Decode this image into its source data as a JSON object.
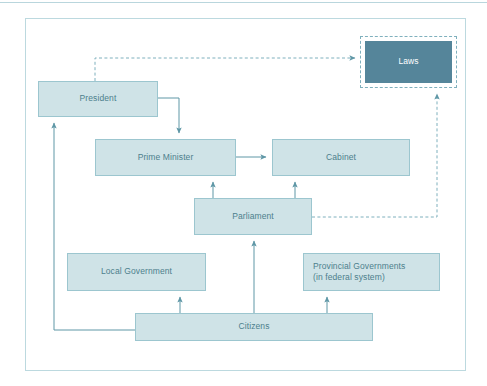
{
  "diagram": {
    "colors": {
      "node_fill": "#cfe3e7",
      "node_border": "#9cc6cf",
      "node_text": "#4d7f8c",
      "highlight_fill": "#55859a",
      "highlight_text": "#ffffff",
      "connector": "#5f97a6",
      "frame_border": "#bcd9df"
    },
    "nodes": [
      {
        "id": "laws",
        "label": "Laws",
        "style": "highlighted-dashed-outline"
      },
      {
        "id": "president",
        "label": "President",
        "style": "normal"
      },
      {
        "id": "prime_minister",
        "label": "Prime Minister",
        "style": "normal"
      },
      {
        "id": "cabinet",
        "label": "Cabinet",
        "style": "normal"
      },
      {
        "id": "parliament",
        "label": "Parliament",
        "style": "normal"
      },
      {
        "id": "local_government",
        "label": "Local Government",
        "style": "normal"
      },
      {
        "id": "provincial_governments",
        "label_line1": "Provincial Governments",
        "label_line2": "(in federal system)",
        "style": "normal-left-aligned"
      },
      {
        "id": "citizens",
        "label": "Citizens",
        "style": "normal"
      }
    ],
    "edges": [
      {
        "from": "president",
        "to": "laws",
        "line": "dashed",
        "arrow": "to"
      },
      {
        "from": "president",
        "to": "prime_minister",
        "line": "solid",
        "arrow": "to"
      },
      {
        "from": "prime_minister",
        "to": "cabinet",
        "line": "solid",
        "arrow": "to"
      },
      {
        "from": "parliament",
        "to": "prime_minister",
        "line": "solid",
        "arrow": "to"
      },
      {
        "from": "parliament",
        "to": "cabinet",
        "line": "solid",
        "arrow": "to"
      },
      {
        "from": "parliament",
        "to": "laws",
        "line": "dashed",
        "arrow": "to"
      },
      {
        "from": "citizens",
        "to": "parliament",
        "line": "solid",
        "arrow": "to"
      },
      {
        "from": "citizens",
        "to": "local_government",
        "line": "solid",
        "arrow": "to"
      },
      {
        "from": "citizens",
        "to": "provincial_governments",
        "line": "solid",
        "arrow": "to"
      },
      {
        "from": "citizens",
        "to": "president",
        "line": "solid",
        "arrow": "to"
      }
    ]
  }
}
